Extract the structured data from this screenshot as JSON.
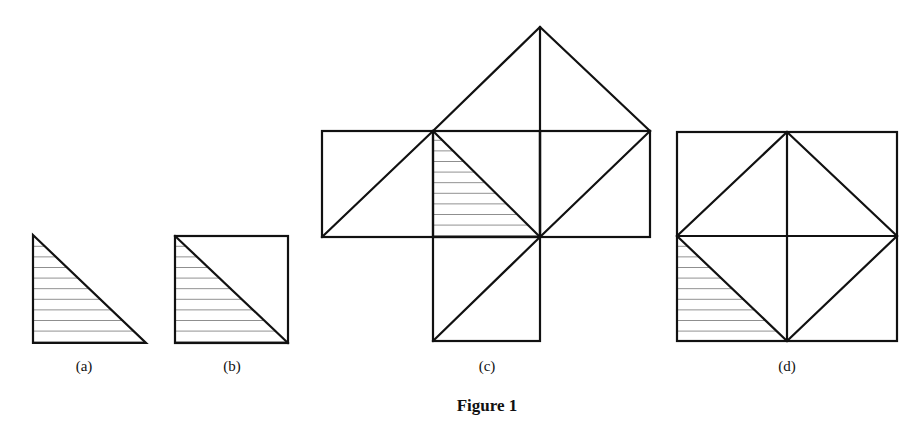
{
  "figure": {
    "caption": "Figure 1",
    "line_color": "#111111",
    "background": "#ffffff",
    "panels": [
      {
        "id": "a",
        "label": "(a)",
        "description": "Right isosceles triangle with horizontal hatching",
        "label_x": 84
      },
      {
        "id": "b",
        "label": "(b)",
        "description": "Square split by a diagonal; lower-left triangle hatched",
        "label_x": 232
      },
      {
        "id": "c",
        "label": "(c)",
        "description": "Center square with four attached right triangles (left, right, top, bottom); hatched triangle inside center square",
        "label_x": 487
      },
      {
        "id": "d",
        "label": "(d)",
        "description": "Large square divided into quarters with an inscribed diamond; lower-left corner triangle hatched",
        "label_x": 787
      }
    ]
  }
}
